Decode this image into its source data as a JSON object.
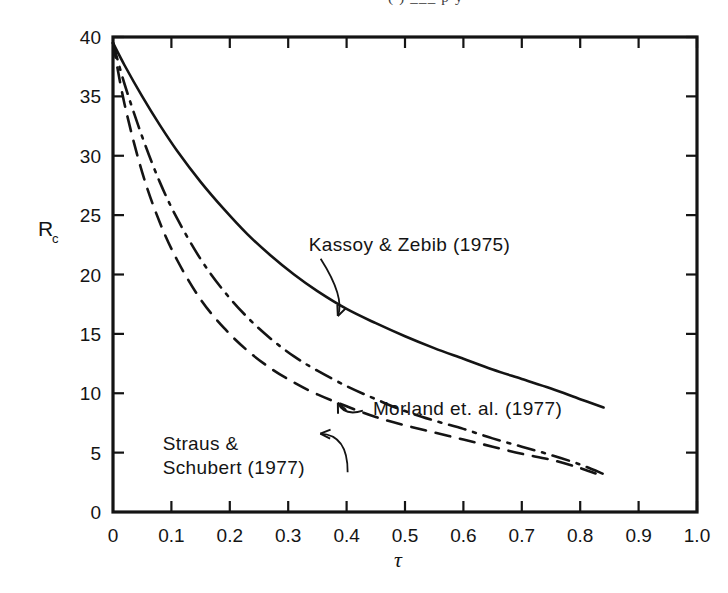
{
  "page": {
    "top_text_fragment": "(          )        ___      p      y"
  },
  "chart_data": {
    "type": "line",
    "title": "",
    "xlabel": "τ",
    "ylabel": "R",
    "ylabel_sub": "c",
    "xlim": [
      0,
      1.0
    ],
    "ylim": [
      0,
      40
    ],
    "grid": false,
    "legend": "inline-annotations",
    "xticks": [
      0,
      0.1,
      0.2,
      0.3,
      0.4,
      0.5,
      0.6,
      0.7,
      0.8,
      0.9,
      1.0
    ],
    "xticklabels": [
      "0",
      "0.1",
      "0.2",
      "0.3",
      "0.4",
      "0.5",
      "0.6",
      "0.7",
      "0.8",
      "0.9",
      "1.0"
    ],
    "yticks": [
      0,
      5,
      10,
      15,
      20,
      25,
      30,
      35,
      40
    ],
    "yticklabels": [
      "0",
      "5",
      "10",
      "15",
      "20",
      "25",
      "30",
      "35",
      "40"
    ],
    "series": [
      {
        "name": "Kassoy & Zebib (1975)",
        "style": "solid",
        "color": "#141414",
        "x": [
          0.0,
          0.02,
          0.05,
          0.08,
          0.11,
          0.15,
          0.19,
          0.23,
          0.27,
          0.31,
          0.35,
          0.4,
          0.45,
          0.5,
          0.55,
          0.6,
          0.65,
          0.7,
          0.75,
          0.8,
          0.84
        ],
        "y": [
          39.5,
          37.6,
          35.0,
          32.6,
          30.4,
          27.8,
          25.5,
          23.4,
          21.6,
          20.0,
          18.6,
          17.1,
          15.9,
          14.8,
          13.8,
          12.9,
          12.0,
          11.2,
          10.4,
          9.5,
          8.8
        ]
      },
      {
        "name": "Morland et. al. (1977)",
        "style": "dashdot",
        "color": "#141414",
        "x": [
          0.0,
          0.02,
          0.05,
          0.08,
          0.11,
          0.15,
          0.19,
          0.23,
          0.27,
          0.31,
          0.35,
          0.4,
          0.45,
          0.5,
          0.55,
          0.6,
          0.65,
          0.7,
          0.75,
          0.8,
          0.84
        ],
        "y": [
          39.5,
          36.0,
          31.6,
          27.8,
          24.7,
          21.3,
          18.6,
          16.4,
          14.6,
          13.1,
          11.9,
          10.6,
          9.5,
          8.5,
          7.7,
          7.0,
          6.2,
          5.5,
          4.8,
          4.0,
          3.2
        ]
      },
      {
        "name": "Straus & Schubert (1977)",
        "style": "dashed",
        "color": "#141414",
        "x": [
          0.0,
          0.02,
          0.05,
          0.08,
          0.11,
          0.15,
          0.19,
          0.23,
          0.27,
          0.31,
          0.35,
          0.4,
          0.45,
          0.5,
          0.55,
          0.6,
          0.65,
          0.7,
          0.75,
          0.8,
          0.84
        ],
        "y": [
          39.5,
          34.3,
          28.6,
          24.4,
          21.2,
          17.9,
          15.5,
          13.6,
          12.1,
          10.9,
          9.9,
          8.9,
          8.0,
          7.3,
          6.7,
          6.1,
          5.5,
          4.9,
          4.4,
          3.7,
          3.0
        ]
      }
    ],
    "annotations": [
      {
        "id": "kassoy",
        "text": "Kassoy & Zebib (1975)",
        "text_x": 0.335,
        "text_y": 22.0,
        "point_x": 0.385,
        "point_y": 16.5
      },
      {
        "id": "morland",
        "text": "Morland et. al. (1977)",
        "text_x": 0.445,
        "text_y": 8.2,
        "point_x": 0.385,
        "point_y": 9.2
      },
      {
        "id": "straus",
        "text_line1": "Straus &",
        "text_line2": "Schubert (1977)",
        "text_x": 0.085,
        "text_y": 5.2,
        "point_x": 0.355,
        "point_y": 6.6
      }
    ]
  }
}
